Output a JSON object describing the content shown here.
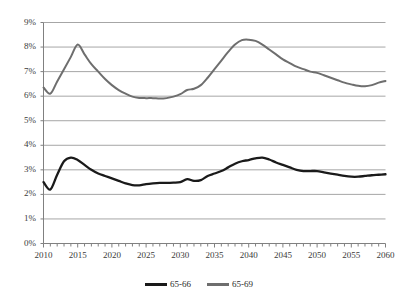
{
  "chart_data": {
    "type": "line",
    "title": "",
    "subtitle": "",
    "xlabel": "",
    "ylabel": "",
    "xlim": [
      2010,
      2060
    ],
    "ylim": [
      0,
      9
    ],
    "grid": true,
    "grid_axis": "y",
    "legend_position": "bottom",
    "y_tick_labels": [
      "0%",
      "1%",
      "2%",
      "3%",
      "4%",
      "5%",
      "6%",
      "7%",
      "8%",
      "9%"
    ],
    "y_tick_values": [
      0,
      1,
      2,
      3,
      4,
      5,
      6,
      7,
      8,
      9
    ],
    "x_tick_labels": [
      "2010",
      "2015",
      "2020",
      "2025",
      "2030",
      "2035",
      "2040",
      "2045",
      "2050",
      "2055",
      "2060"
    ],
    "x_tick_values": [
      2010,
      2015,
      2020,
      2025,
      2030,
      2035,
      2040,
      2045,
      2050,
      2055,
      2060
    ],
    "x_minor_step": 1,
    "x": [
      2010,
      2011,
      2012,
      2013,
      2014,
      2015,
      2016,
      2017,
      2018,
      2019,
      2020,
      2021,
      2022,
      2023,
      2024,
      2025,
      2026,
      2027,
      2028,
      2029,
      2030,
      2031,
      2032,
      2033,
      2034,
      2035,
      2036,
      2037,
      2038,
      2039,
      2040,
      2041,
      2042,
      2043,
      2044,
      2045,
      2046,
      2047,
      2048,
      2049,
      2050,
      2051,
      2052,
      2053,
      2054,
      2055,
      2056,
      2057,
      2058,
      2059,
      2060
    ],
    "series": [
      {
        "name": "65-66",
        "color": "#1a1a1a",
        "values": [
          2.5,
          2.2,
          2.8,
          3.35,
          3.5,
          3.4,
          3.2,
          3.0,
          2.85,
          2.75,
          2.65,
          2.55,
          2.45,
          2.38,
          2.37,
          2.42,
          2.45,
          2.47,
          2.47,
          2.48,
          2.5,
          2.62,
          2.55,
          2.58,
          2.75,
          2.85,
          2.95,
          3.1,
          3.25,
          3.35,
          3.4,
          3.47,
          3.5,
          3.42,
          3.3,
          3.2,
          3.1,
          3.0,
          2.95,
          2.95,
          2.95,
          2.9,
          2.85,
          2.8,
          2.75,
          2.72,
          2.72,
          2.75,
          2.78,
          2.8,
          2.82
        ]
      },
      {
        "name": "65-69",
        "color": "#6e6e6e",
        "values": [
          6.35,
          6.1,
          6.6,
          7.1,
          7.6,
          8.1,
          7.7,
          7.3,
          7.0,
          6.7,
          6.45,
          6.25,
          6.1,
          5.98,
          5.93,
          5.92,
          5.92,
          5.9,
          5.92,
          5.98,
          6.08,
          6.25,
          6.3,
          6.45,
          6.75,
          7.1,
          7.45,
          7.8,
          8.1,
          8.28,
          8.3,
          8.25,
          8.1,
          7.9,
          7.7,
          7.5,
          7.35,
          7.2,
          7.1,
          7.0,
          6.95,
          6.85,
          6.75,
          6.65,
          6.55,
          6.48,
          6.42,
          6.4,
          6.45,
          6.55,
          6.62
        ]
      }
    ],
    "legend": [
      {
        "label": "65-66",
        "color": "#1a1a1a"
      },
      {
        "label": "65-69",
        "color": "#6e6e6e"
      }
    ]
  },
  "axis_colors": {
    "grid": "#a6a6a6",
    "axis": "#808080",
    "tick_text": "#3b3b3b"
  }
}
